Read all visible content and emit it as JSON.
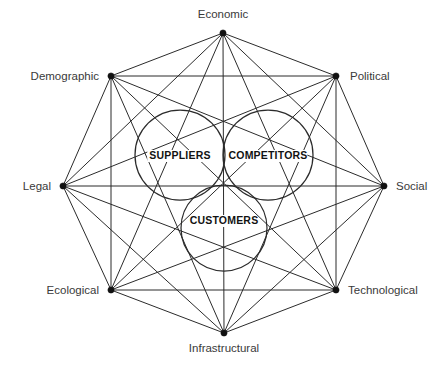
{
  "diagram": {
    "type": "octagon-complete-graph-with-venn",
    "canvas": {
      "width": 447,
      "height": 365
    },
    "center": {
      "x": 224,
      "y": 186
    },
    "colors": {
      "background": "#ffffff",
      "line": "#2b2b2b",
      "vertex_dot": "#111111",
      "vertex_label": "#3a3a3a",
      "ring_label": "#121212"
    },
    "outer_nodes": [
      {
        "id": "economic",
        "label": "Economic",
        "x": 223,
        "y": 33,
        "label_x": 223,
        "label_y": 18,
        "anchor": "middle"
      },
      {
        "id": "political",
        "label": "Political",
        "x": 336,
        "y": 76,
        "label_x": 350,
        "label_y": 80,
        "anchor": "start"
      },
      {
        "id": "social",
        "label": "Social",
        "x": 384,
        "y": 186,
        "label_x": 396,
        "label_y": 190,
        "anchor": "start"
      },
      {
        "id": "technological",
        "label": "Technological",
        "x": 336,
        "y": 290,
        "label_x": 348,
        "label_y": 294,
        "anchor": "start"
      },
      {
        "id": "infrastructural",
        "label": "Infrastructural",
        "x": 224,
        "y": 333,
        "label_x": 224,
        "label_y": 352,
        "anchor": "middle"
      },
      {
        "id": "ecological",
        "label": "Ecological",
        "x": 111,
        "y": 290,
        "label_x": 99,
        "label_y": 294,
        "anchor": "end"
      },
      {
        "id": "legal",
        "label": "Legal",
        "x": 63,
        "y": 186,
        "label_x": 51,
        "label_y": 190,
        "anchor": "end"
      },
      {
        "id": "demographic",
        "label": "Demographic",
        "x": 111,
        "y": 76,
        "label_x": 99,
        "label_y": 80,
        "anchor": "end"
      }
    ],
    "inner_rings": [
      {
        "id": "suppliers",
        "label": "SUPPLIERS",
        "cx": 180,
        "cy": 155,
        "r": 45,
        "label_x": 180,
        "label_y": 159
      },
      {
        "id": "competitors",
        "label": "COMPETITORS",
        "cx": 268,
        "cy": 155,
        "r": 45,
        "label_x": 268,
        "label_y": 159
      },
      {
        "id": "customers",
        "label": "CUSTOMERS",
        "cx": 224,
        "cy": 228,
        "r": 43,
        "label_x": 224,
        "label_y": 224
      }
    ],
    "edge_note": "complete graph: every outer node connects to every other outer node"
  }
}
